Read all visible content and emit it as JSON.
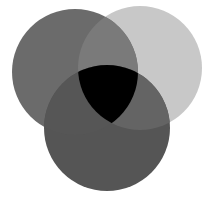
{
  "diagram": {
    "type": "venn",
    "sets": [
      {
        "id": "left",
        "cx": 75,
        "cy": 72,
        "r": 63,
        "color": "#6b6b6b"
      },
      {
        "id": "right",
        "cx": 140,
        "cy": 68,
        "r": 62,
        "color": "#c8c8c8"
      },
      {
        "id": "bottom",
        "cx": 107,
        "cy": 128,
        "r": 63,
        "color": "#555555"
      }
    ],
    "intersections": {
      "left_right": "#7a7a7a",
      "left_bottom": "#565656",
      "right_bottom": "#646464",
      "all_three": "#000000"
    },
    "background": "#ffffff"
  }
}
